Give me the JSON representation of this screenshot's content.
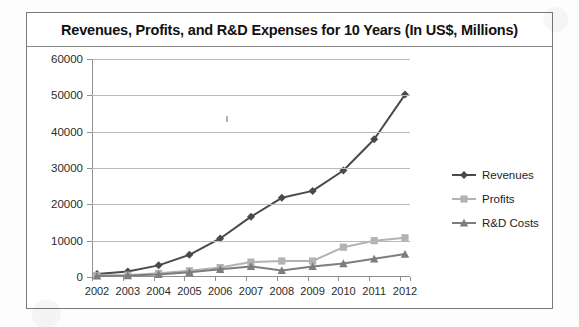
{
  "chart_data": {
    "type": "line",
    "title": "Revenues, Profits, and R&D Expenses for 10 Years (In US$, Millions)",
    "xlabel": "",
    "ylabel": "",
    "categories": [
      "2002",
      "2003",
      "2004",
      "2005",
      "2006",
      "2007",
      "2008",
      "2009",
      "2010",
      "2011",
      "2012"
    ],
    "ylim": [
      0,
      60000
    ],
    "ytick_values": [
      0,
      10000,
      20000,
      30000,
      40000,
      50000,
      60000
    ],
    "ytick_labels": [
      "0",
      "10000",
      "20000",
      "30000",
      "40000",
      "50000",
      "60000"
    ],
    "grid": true,
    "legend_position": "right",
    "series": [
      {
        "name": "Revenues",
        "color": "#4a4a4a",
        "marker": "diamond",
        "values": [
          800,
          1500,
          3200,
          6100,
          10600,
          16600,
          21800,
          23700,
          29300,
          37900,
          50200
        ]
      },
      {
        "name": "Profits",
        "color": "#b3b3b3",
        "marker": "square",
        "values": [
          400,
          500,
          1000,
          1700,
          2600,
          4100,
          4400,
          4400,
          8200,
          10000,
          10800
        ]
      },
      {
        "name": "R&D Costs",
        "color": "#7d7d7d",
        "marker": "triangle",
        "values": [
          300,
          400,
          700,
          1300,
          2100,
          2900,
          1800,
          2900,
          3700,
          5000,
          6300
        ]
      }
    ]
  },
  "legend": {
    "items": [
      {
        "label": "Revenues"
      },
      {
        "label": "Profits"
      },
      {
        "label": "R&D Costs"
      }
    ]
  },
  "colors": {
    "revenues": "#4a4a4a",
    "profits": "#b3b3b3",
    "rd_costs": "#7d7d7d",
    "gridline": "#b9b9b9",
    "axis": "#8f8f8f",
    "frame": "#7a7a7a"
  }
}
